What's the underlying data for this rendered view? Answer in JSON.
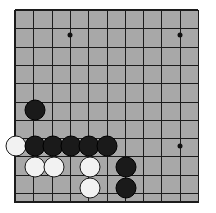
{
  "app": {
    "title": "Go Board",
    "description": "Partial view of a Go (Weiqi/Baduk) board showing the lower-left corner area with a black group and white stones"
  },
  "board": {
    "background_color": "#ffffff",
    "surface_color": "#a8a8a8",
    "line_color": "#1c1c1c",
    "black_stone_color": "#1a1a1a",
    "white_stone_color": "#f2f2f2",
    "left": 15,
    "top": 10,
    "right": 198,
    "bottom": 203,
    "spacing": 18.3,
    "columns": 11,
    "rows": 11,
    "column_x": [
      15,
      33.3,
      51.6,
      69.9,
      88.2,
      106.5,
      124.8,
      143.1,
      161.4,
      179.7,
      198
    ],
    "row_y": [
      10,
      28.3,
      46.6,
      64.9,
      83.2,
      101.5,
      119.8,
      138.1,
      156.4,
      174.7,
      193
    ],
    "stone_radius": 10.5
  },
  "star_points": [
    {
      "name": "star-point-upper-left",
      "x": 70,
      "y": 35
    },
    {
      "name": "star-point-upper-right",
      "x": 180,
      "y": 35
    },
    {
      "name": "star-point-right",
      "x": 180,
      "y": 146
    }
  ],
  "stones": [
    {
      "name": "black-stone-1",
      "color": "black",
      "x": 35,
      "y": 110
    },
    {
      "name": "white-stone-1",
      "color": "white",
      "x": 16,
      "y": 146
    },
    {
      "name": "black-stone-2",
      "color": "black",
      "x": 35,
      "y": 146
    },
    {
      "name": "black-stone-3",
      "color": "black",
      "x": 53,
      "y": 146
    },
    {
      "name": "black-stone-4",
      "color": "black",
      "x": 71,
      "y": 146
    },
    {
      "name": "black-stone-5",
      "color": "black",
      "x": 89,
      "y": 146
    },
    {
      "name": "black-stone-6",
      "color": "black",
      "x": 107,
      "y": 146
    },
    {
      "name": "white-stone-2",
      "color": "white",
      "x": 35,
      "y": 167
    },
    {
      "name": "white-stone-3",
      "color": "white",
      "x": 54,
      "y": 167
    },
    {
      "name": "white-stone-4",
      "color": "white",
      "x": 90,
      "y": 167
    },
    {
      "name": "black-stone-7",
      "color": "black",
      "x": 126,
      "y": 167
    },
    {
      "name": "white-stone-5",
      "color": "white",
      "x": 90,
      "y": 188
    },
    {
      "name": "black-stone-8",
      "color": "black",
      "x": 126,
      "y": 188
    }
  ]
}
